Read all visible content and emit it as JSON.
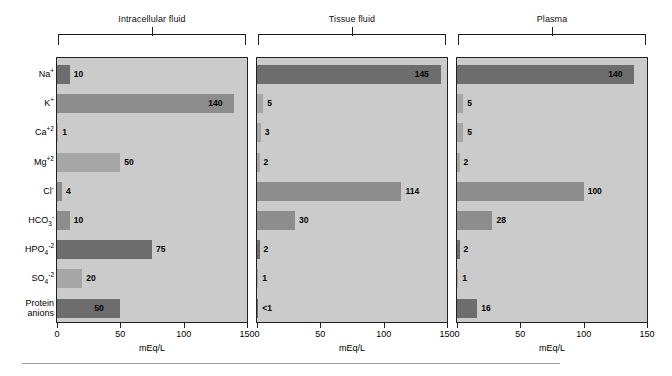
{
  "chart_data": {
    "type": "bar",
    "orientation": "horizontal",
    "title": "",
    "xlabel": "mEq/L",
    "ylabel": "",
    "xlim": [
      0,
      150
    ],
    "xticks": [
      0,
      50,
      100,
      150
    ],
    "xtick_labels": [
      "0",
      "50",
      "100",
      "150"
    ],
    "grid": false,
    "legend": false,
    "categories": [
      "Na+",
      "K+",
      "Ca+2",
      "Mg+2",
      "Cl-",
      "HCO3-",
      "HPO4-2",
      "SO4-2",
      "Protein anions"
    ],
    "panels": [
      "Intracellular fluid",
      "Tissue fluid",
      "Plasma"
    ],
    "series": [
      {
        "name": "Intracellular fluid",
        "values": [
          10,
          140,
          1,
          50,
          4,
          10,
          75,
          20,
          50
        ]
      },
      {
        "name": "Tissue fluid",
        "values": [
          145,
          5,
          3,
          2,
          114,
          30,
          2,
          1,
          0.5
        ]
      },
      {
        "name": "Plasma",
        "values": [
          140,
          5,
          5,
          2,
          100,
          28,
          2,
          1,
          16
        ]
      }
    ],
    "value_labels": [
      [
        "10",
        "140",
        "1",
        "50",
        "4",
        "10",
        "75",
        "20",
        "50"
      ],
      [
        "145",
        "5",
        "3",
        "2",
        "114",
        "30",
        "2",
        "1",
        "<1"
      ],
      [
        "140",
        "5",
        "5",
        "2",
        "100",
        "28",
        "2",
        "1",
        "16"
      ]
    ]
  },
  "ions": [
    {
      "base": "Na",
      "sup": "+",
      "sub": "",
      "line2": ""
    },
    {
      "base": "K",
      "sup": "+",
      "sub": "",
      "line2": ""
    },
    {
      "base": "Ca",
      "sup": "+2",
      "sub": "",
      "line2": ""
    },
    {
      "base": "Mg",
      "sup": "+2",
      "sub": "",
      "line2": ""
    },
    {
      "base": "Cl",
      "sup": "-",
      "sub": "",
      "line2": ""
    },
    {
      "base": "HCO",
      "sup": "-",
      "sub": "3",
      "line2": ""
    },
    {
      "base": "HPO",
      "sup": "-2",
      "sub": "4",
      "line2": ""
    },
    {
      "base": "SO",
      "sup": "-2",
      "sub": "4",
      "line2": ""
    },
    {
      "base": "Protein",
      "sup": "",
      "sub": "",
      "line2": "anions"
    }
  ],
  "panels": [
    {
      "title": "Intracellular fluid",
      "axis_title": "mEq/L",
      "bars": [
        {
          "label": "10",
          "value": 10,
          "shade": "dark",
          "inside": false
        },
        {
          "label": "140",
          "value": 140,
          "shade": "mid",
          "inside": true
        },
        {
          "label": "1",
          "value": 1,
          "shade": "light",
          "inside": false
        },
        {
          "label": "50",
          "value": 50,
          "shade": "light",
          "inside": false
        },
        {
          "label": "4",
          "value": 4,
          "shade": "mid",
          "inside": false
        },
        {
          "label": "10",
          "value": 10,
          "shade": "mid",
          "inside": false
        },
        {
          "label": "75",
          "value": 75,
          "shade": "dark",
          "inside": false
        },
        {
          "label": "20",
          "value": 20,
          "shade": "light",
          "inside": false
        },
        {
          "label": "50",
          "value": 50,
          "shade": "dark",
          "inside": true
        }
      ]
    },
    {
      "title": "Tissue fluid",
      "axis_title": "mEq/L",
      "bars": [
        {
          "label": "145",
          "value": 145,
          "shade": "dark",
          "inside": true
        },
        {
          "label": "5",
          "value": 5,
          "shade": "light",
          "inside": false
        },
        {
          "label": "3",
          "value": 3,
          "shade": "light",
          "inside": false
        },
        {
          "label": "2",
          "value": 2,
          "shade": "light",
          "inside": false
        },
        {
          "label": "114",
          "value": 114,
          "shade": "mid",
          "inside": false
        },
        {
          "label": "30",
          "value": 30,
          "shade": "mid",
          "inside": false
        },
        {
          "label": "2",
          "value": 2,
          "shade": "dark",
          "inside": false
        },
        {
          "label": "1",
          "value": 1,
          "shade": "light",
          "inside": false
        },
        {
          "label": "<1",
          "value": 0.5,
          "shade": "dark",
          "inside": false
        }
      ]
    },
    {
      "title": "Plasma",
      "axis_title": "mEq/L",
      "bars": [
        {
          "label": "140",
          "value": 140,
          "shade": "dark",
          "inside": true
        },
        {
          "label": "5",
          "value": 5,
          "shade": "light",
          "inside": false
        },
        {
          "label": "5",
          "value": 5,
          "shade": "light",
          "inside": false
        },
        {
          "label": "2",
          "value": 2,
          "shade": "light",
          "inside": false
        },
        {
          "label": "100",
          "value": 100,
          "shade": "mid",
          "inside": false
        },
        {
          "label": "28",
          "value": 28,
          "shade": "mid",
          "inside": false
        },
        {
          "label": "2",
          "value": 2,
          "shade": "dark",
          "inside": false
        },
        {
          "label": "1",
          "value": 1,
          "shade": "light",
          "inside": false
        },
        {
          "label": "16",
          "value": 16,
          "shade": "dark",
          "inside": false
        }
      ]
    }
  ],
  "axis": {
    "ticks": [
      "0",
      "50",
      "100",
      "150"
    ],
    "tick_values": [
      0,
      50,
      100,
      150
    ],
    "unit_label": "mEq/L"
  },
  "colors": {
    "panel_background": "#cbcbcb",
    "bar_dark": "#6d6d6d",
    "bar_mid": "#8d8d8d",
    "bar_light": "#a6a6a6",
    "border": "#222222",
    "rule": "#9a9a9a"
  }
}
